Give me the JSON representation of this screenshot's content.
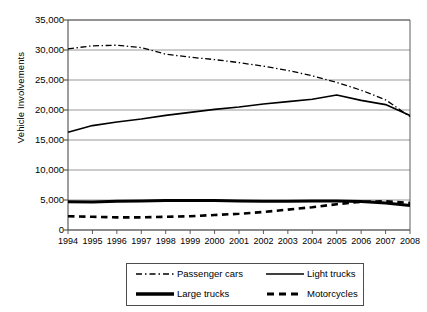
{
  "chart_data": {
    "type": "line",
    "title": "",
    "xlabel": "",
    "ylabel": "Vehicle Involvements",
    "categories": [
      1994,
      1995,
      1996,
      1997,
      1998,
      1999,
      2000,
      2001,
      2002,
      2003,
      2004,
      2005,
      2006,
      2007,
      2008
    ],
    "xtick_labels": [
      "1994",
      "1995",
      "1996",
      "1997",
      "1998",
      "1999",
      "2000",
      "2001",
      "2002",
      "2003",
      "2004",
      "2005",
      "2006",
      "2007",
      "2008"
    ],
    "ytick_labels": [
      "0",
      "5,000",
      "10,000",
      "15,000",
      "20,000",
      "25,000",
      "30,000",
      "35,000"
    ],
    "ytick_values": [
      0,
      5000,
      10000,
      15000,
      20000,
      25000,
      30000,
      35000
    ],
    "ylim": [
      0,
      35000
    ],
    "grid": true,
    "grid_axis": "y",
    "legend_position": "bottom",
    "series": [
      {
        "name": "Passenger cars",
        "style": "dash-dot",
        "color": "#000000",
        "width": 1.3,
        "values": [
          30200,
          30700,
          30800,
          30400,
          29300,
          28800,
          28400,
          27900,
          27300,
          26600,
          25700,
          24600,
          23300,
          21700,
          18900
        ]
      },
      {
        "name": "Light trucks",
        "style": "solid",
        "color": "#000000",
        "width": 1.6,
        "values": [
          16300,
          17400,
          18000,
          18500,
          19100,
          19600,
          20100,
          20500,
          21000,
          21400,
          21800,
          22500,
          21600,
          20900,
          19100
        ]
      },
      {
        "name": "Large trucks",
        "style": "solid",
        "color": "#000000",
        "width": 3.0,
        "values": [
          4700,
          4650,
          4800,
          4850,
          4900,
          4900,
          4900,
          4850,
          4800,
          4800,
          4850,
          4850,
          4750,
          4500,
          4100
        ]
      },
      {
        "name": "Motorcycles",
        "style": "dashed",
        "color": "#000000",
        "width": 2.6,
        "values": [
          2300,
          2200,
          2100,
          2100,
          2200,
          2300,
          2500,
          2700,
          3000,
          3400,
          3800,
          4300,
          4700,
          4800,
          4500
        ]
      }
    ]
  },
  "legend": {
    "items": [
      {
        "label": "Passenger cars",
        "style": "dash-dot"
      },
      {
        "label": "Light trucks",
        "style": "solid-thin"
      },
      {
        "label": "Large trucks",
        "style": "solid-thick"
      },
      {
        "label": "Motorcycles",
        "style": "dashed"
      }
    ]
  },
  "colors": {
    "line": "#000000",
    "grid": "#7f7f7f",
    "axis": "#4d4d4d",
    "background": "#ffffff"
  }
}
